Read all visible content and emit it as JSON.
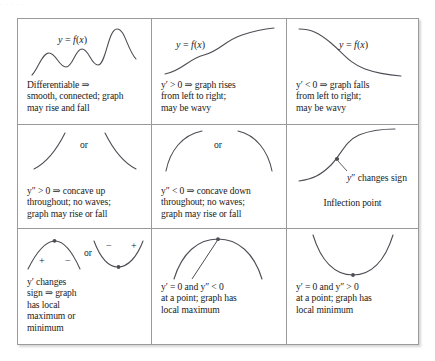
{
  "artifact": {
    "type": "calculus-reference-table",
    "top_sliver_text": "· · · · ·",
    "columns": 3,
    "rows": 3,
    "ink_color": "#4d4d55",
    "border_color": "#9a9a9a",
    "background_color": "#ffffff"
  },
  "cells": {
    "r1c1": {
      "curve_label": "y = f(x)",
      "caption_line1": "Differentiable ⇒",
      "caption_line2": "smooth, connected; graph",
      "caption_line3": "may rise and fall",
      "figure": "wavy-rising-curve"
    },
    "r1c2": {
      "curve_label": "y = f(x)",
      "caption_line1": "y′ > 0 ⇒ graph rises",
      "caption_line2": "from left to right;",
      "caption_line3": "may be wavy",
      "figure": "increasing-s-curve"
    },
    "r1c3": {
      "curve_label": "y = f(x)",
      "caption_line1": "y′ < 0 ⇒ graph falls",
      "caption_line2": "from left to right;",
      "caption_line3": "may be wavy",
      "figure": "decreasing-s-curve"
    },
    "r2c1": {
      "or_label": "or",
      "caption_line1": "y″ > 0 ⇒ concave up",
      "caption_line2": "throughout; no waves;",
      "caption_line3": "graph may rise or fall",
      "figure": "concave-up-pair"
    },
    "r2c2": {
      "or_label": "or",
      "caption_line1": "y″ < 0 ⇒ concave down",
      "caption_line2": "throughout; no waves;",
      "caption_line3": "graph may rise or fall",
      "figure": "concave-down-pair"
    },
    "r2c3": {
      "annotation": "y″ changes sign",
      "caption_line1": "Inflection point",
      "figure": "inflection-s-curve-with-point"
    },
    "r3c1": {
      "sign_left_arch": "+",
      "sign_right_arch": "−",
      "or_label": "or",
      "sign_left_valley": "−",
      "sign_right_valley": "+",
      "caption_line1": "y′ changes",
      "caption_line2": "sign ⇒ graph",
      "caption_line3": "has local",
      "caption_line4": "maximum or",
      "caption_line5": "minimum",
      "figure": "arch-and-valley-with-signs"
    },
    "r3c2": {
      "caption_line1": "y′ = 0  and  y″ < 0",
      "caption_line2": "at a point; graph has",
      "caption_line3": "local maximum",
      "figure": "downward-parabola-with-vertex-point"
    },
    "r3c3": {
      "caption_line1": "y′ = 0  and  y″ > 0",
      "caption_line2": "at a point; graph has",
      "caption_line3": "local minimum",
      "figure": "upward-parabola-with-vertex-point"
    }
  }
}
